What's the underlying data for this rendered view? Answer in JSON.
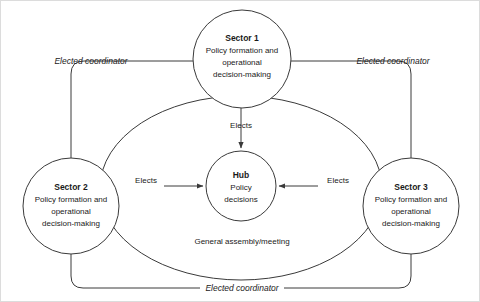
{
  "diagram": {
    "type": "organizational-network-diagram",
    "colors": {
      "stroke": "#3a3a3a",
      "text": "#1a1a1a",
      "background": "#ffffff",
      "frame": "#dcdcdc"
    },
    "nodes": [
      {
        "id": "sector1",
        "title": "Sector 1",
        "lines": [
          "Policy formation and",
          "operational",
          "decision-making"
        ],
        "cx": 241,
        "cy": 58,
        "r": 49
      },
      {
        "id": "sector2",
        "title": "Sector 2",
        "lines": [
          "Policy formation and",
          "operational",
          "decision-making"
        ],
        "cx": 70,
        "cy": 205,
        "r": 48
      },
      {
        "id": "sector3",
        "title": "Sector 3",
        "lines": [
          "Policy formation and",
          "operational",
          "decision-making"
        ],
        "cx": 410,
        "cy": 205,
        "r": 48
      },
      {
        "id": "hub",
        "title": "Hub",
        "lines": [
          "Policy",
          "decisions"
        ],
        "cx": 240,
        "cy": 185,
        "r": 35
      }
    ],
    "edge_labels": {
      "elects_top": "Elects",
      "elects_left": "Elects",
      "elects_right": "Elects",
      "coordinator_top_left": "Elected coordinator",
      "coordinator_top_right": "Elected coordinator",
      "coordinator_bottom": "Elected coordinator",
      "assembly": "General assembly/meeting"
    }
  }
}
